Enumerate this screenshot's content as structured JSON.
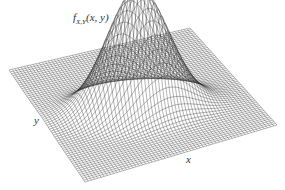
{
  "figure": {
    "function_label": {
      "name": "f",
      "subscript": "X,Y",
      "args": "(x, y)"
    },
    "axis_labels": {
      "x": "x",
      "y": "y"
    },
    "line_color": "#2a2a2a",
    "background": "#ffffff"
  },
  "surface": {
    "type": "surface",
    "shape": "single gaussian bump",
    "x_range": [
      -3,
      3
    ],
    "y_range": [
      -3,
      3
    ],
    "grid_lines_per_axis": 60,
    "peak": {
      "x": 0.3,
      "y": -0.2,
      "relative_height": 1.0
    },
    "spread": {
      "sx": 0.55,
      "sy": 0.9,
      "correlation": 0.35
    }
  }
}
